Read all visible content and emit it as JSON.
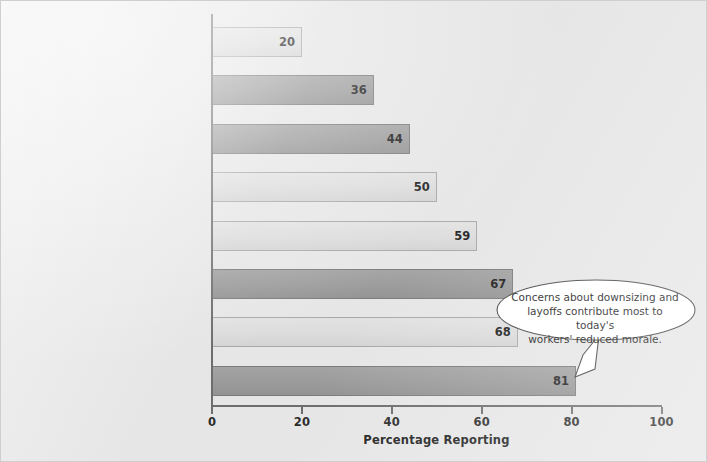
{
  "chart_data": {
    "type": "bar",
    "orientation": "horizontal",
    "title": "",
    "xlabel": "Percentage Reporting",
    "ylabel": "",
    "xlim": [
      0,
      100
    ],
    "xticks": [
      0,
      20,
      40,
      60,
      80,
      100
    ],
    "grid": false,
    "legend": "none",
    "categories": [
      "Increased competition",
      "Mergers or acquisitions",
      "Difficulty in attracting employees",
      "Reorganization of the company",
      "Difficulty in changing employees to meet\ncustomers' needs",
      "Declining sales of profits",
      "Difficulty in retaining employees",
      "Downsizing or layoffs"
    ],
    "values": [
      20,
      36,
      44,
      50,
      59,
      67,
      68,
      81
    ],
    "value_labels": [
      "20",
      "36",
      "44",
      "50",
      "59",
      "67",
      "68",
      "81"
    ],
    "bar_shades": [
      "light",
      "dark",
      "dark",
      "light",
      "light",
      "dark",
      "light",
      "dark"
    ],
    "annotations": [
      {
        "text": "Concerns about downsizing and layoffs contribute most to today's workers' reduced morale.",
        "lines": [
          "Concerns about downsizing and",
          "layoffs contribute most to today's",
          "workers' reduced morale."
        ],
        "points_to_category": "Downsizing or layoffs",
        "points_to_value": 81,
        "shape": "ellipse-callout"
      }
    ]
  },
  "tick_labels": [
    "0",
    "20",
    "40",
    "60",
    "80",
    "100"
  ],
  "colors": {
    "background": "#e6e6e6",
    "bar_light": "#dcdcdc",
    "bar_dark": "#9b9b9b",
    "bar_border_light": "#a8a8a8",
    "bar_border_dark": "#7b7b7b",
    "axis": "#6d6d6d",
    "text": "#2c2c2c"
  }
}
